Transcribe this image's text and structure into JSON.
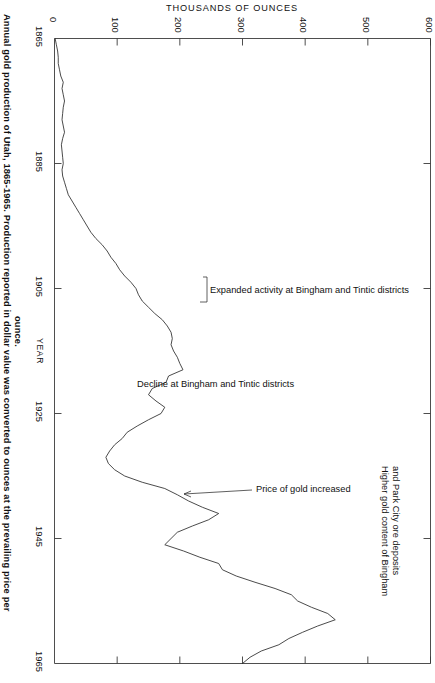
{
  "figure": {
    "caption_line_1": "Annual gold production of Utah, 1865-1965. Production reported in dollar value was converted to ounces at the prevailing price per",
    "caption_line_2": "ounce.",
    "background_color": "#ffffff",
    "line_color": "#2b2b2b",
    "axis_color": "#3a3a3a"
  },
  "chart_data": {
    "type": "line",
    "title": "Annual gold production of Utah, 1865-1965",
    "orientation": "horizontal-value-axis-top",
    "xlabel": "THOUSANDS OF OUNCES",
    "ylabel": "YEAR",
    "xlim": [
      0,
      600
    ],
    "ylim": [
      1865,
      1965
    ],
    "grid": false,
    "legend": "none",
    "xticks": [
      0,
      100,
      200,
      300,
      400,
      500,
      600
    ],
    "xtick_labels": [
      "0",
      "100",
      "200",
      "300",
      "400",
      "500",
      "600"
    ],
    "yticks": [
      1865,
      1885,
      1905,
      1925,
      1945,
      1965
    ],
    "ytick_labels": [
      "1865",
      "1885",
      "1905",
      "1925",
      "1945",
      "1965"
    ],
    "value_unit": "thousands of ounces",
    "x": [
      1865,
      1866,
      1867,
      1868,
      1869,
      1870,
      1871,
      1872,
      1873,
      1874,
      1875,
      1876,
      1877,
      1878,
      1879,
      1880,
      1881,
      1882,
      1883,
      1884,
      1885,
      1886,
      1887,
      1888,
      1889,
      1890,
      1891,
      1892,
      1893,
      1894,
      1895,
      1896,
      1897,
      1898,
      1899,
      1900,
      1901,
      1902,
      1903,
      1904,
      1905,
      1906,
      1907,
      1908,
      1909,
      1910,
      1911,
      1912,
      1913,
      1914,
      1915,
      1916,
      1917,
      1918,
      1919,
      1920,
      1921,
      1922,
      1923,
      1924,
      1925,
      1926,
      1927,
      1928,
      1929,
      1930,
      1931,
      1932,
      1933,
      1934,
      1935,
      1936,
      1937,
      1938,
      1939,
      1940,
      1941,
      1942,
      1943,
      1944,
      1945,
      1946,
      1947,
      1948,
      1949,
      1950,
      1951,
      1952,
      1953,
      1954,
      1955,
      1956,
      1957,
      1958,
      1959,
      1960,
      1961,
      1962,
      1963,
      1964,
      1965
    ],
    "values": [
      1,
      3,
      5,
      6,
      6,
      8,
      10,
      14,
      12,
      14,
      16,
      14,
      13,
      12,
      14,
      16,
      13,
      11,
      12,
      13,
      14,
      12,
      13,
      16,
      19,
      22,
      28,
      34,
      40,
      46,
      52,
      58,
      66,
      76,
      84,
      90,
      98,
      104,
      112,
      122,
      130,
      134,
      140,
      150,
      160,
      172,
      180,
      186,
      188,
      186,
      190,
      196,
      200,
      205,
      182,
      178,
      156,
      150,
      162,
      176,
      170,
      150,
      132,
      116,
      108,
      96,
      88,
      82,
      86,
      96,
      112,
      140,
      176,
      196,
      214,
      236,
      262,
      246,
      220,
      196,
      186,
      176,
      206,
      232,
      262,
      268,
      290,
      320,
      352,
      378,
      388,
      410,
      436,
      448,
      420,
      396,
      374,
      358,
      330,
      312,
      300
    ],
    "annotations": [
      {
        "text": "Expanded activity at Bingham and Tintic districts",
        "target_year": 1906,
        "target_value": 196
      },
      {
        "text": "Decline at Bingham and Tintic districts",
        "target_year": 1922,
        "target_value": 150
      },
      {
        "text": "Price of gold increased",
        "target_year": 1934,
        "target_value": 96
      },
      {
        "text": "Higher gold content of Bingham and Park City ore deposits",
        "target_year": 1955,
        "target_value": 420
      }
    ]
  }
}
